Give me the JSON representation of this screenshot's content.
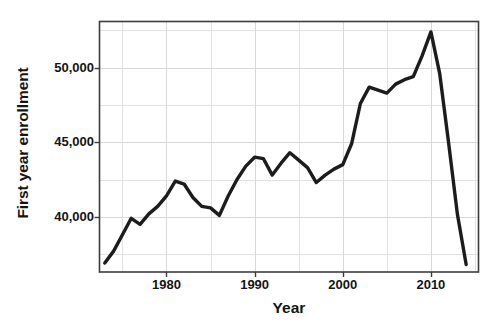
{
  "chart_data": {
    "type": "line",
    "title": "",
    "xlabel": "Year",
    "ylabel": "First year enrollment",
    "xlim": [
      1972.4,
      2015.4
    ],
    "ylim": [
      36300,
      53100
    ],
    "grid": true,
    "legend": null,
    "x_ticks": [
      1980,
      1990,
      2000,
      2010
    ],
    "x_tick_labels": [
      "1980",
      "1990",
      "2000",
      "2010"
    ],
    "x_minor_ticks": [
      1975,
      1985,
      1995,
      2005,
      2015
    ],
    "y_ticks": [
      40000,
      45000,
      50000
    ],
    "y_tick_labels": [
      "40,000",
      "45,000",
      "50,000"
    ],
    "y_minor_ticks": [
      37500,
      42500,
      47500,
      52500
    ],
    "line_color": "#1c1c1c",
    "line_width": 3.4,
    "grid_color": "#d8d8d8",
    "axis_color": "#3c3c3c",
    "background": "#ffffff",
    "x": [
      1973,
      1974,
      1975,
      1976,
      1977,
      1978,
      1979,
      1980,
      1981,
      1982,
      1983,
      1984,
      1985,
      1986,
      1987,
      1988,
      1989,
      1990,
      1991,
      1992,
      1993,
      1994,
      1995,
      1996,
      1997,
      1998,
      1999,
      2000,
      2001,
      2002,
      2003,
      2004,
      2005,
      2006,
      2007,
      2008,
      2009,
      2010,
      2011,
      2012,
      2013,
      2014
    ],
    "values": [
      36900,
      37700,
      38800,
      39900,
      39500,
      40200,
      40700,
      41400,
      42400,
      42200,
      41300,
      40700,
      40600,
      40100,
      41400,
      42500,
      43400,
      44000,
      43900,
      42800,
      43600,
      44300,
      43800,
      43300,
      42300,
      42800,
      43200,
      43500,
      44900,
      47600,
      48700,
      48500,
      48300,
      48900,
      49200,
      49400,
      50800,
      52400,
      49600,
      45000,
      40200,
      36800
    ],
    "series_name": "First year enrollment",
    "annotations": []
  },
  "axes": {
    "y_title": "First year enrollment",
    "x_title": "Year"
  }
}
